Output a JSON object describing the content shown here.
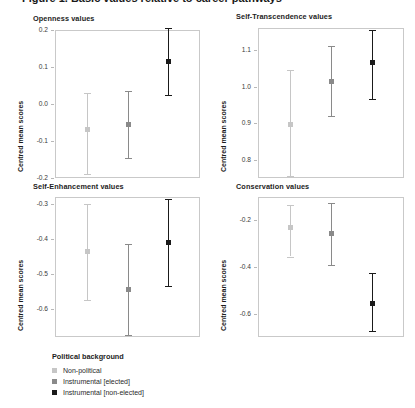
{
  "figure": {
    "title_clipped": "Figure 1. Basic values relative to career pathways"
  },
  "axis": {
    "ylabel": "Centred mean scores"
  },
  "legend": {
    "title": "Political background",
    "entries": [
      {
        "label": "Non-political",
        "color": "#c6c6c6"
      },
      {
        "label": "Instrumental [elected]",
        "color": "#8a8a8a"
      },
      {
        "label": "Instrumental [non-elected]",
        "color": "#1a1a1a"
      }
    ]
  },
  "chart_data": {
    "type": "scatter",
    "title": "Figure 1. Basic values relative to career pathways",
    "xlabel": "",
    "ylabel": "Centred mean scores",
    "grid": false,
    "legend_position": "bottom-left",
    "legend_title": "Political background",
    "categories": [
      "Non-political",
      "Instrumental [elected]",
      "Instrumental [non-elected]"
    ],
    "colors": [
      "#c6c6c6",
      "#8a8a8a",
      "#1a1a1a"
    ],
    "error_bars": "95% confidence interval",
    "panels": [
      {
        "title": "Openness values",
        "ylim": [
          -0.2,
          0.2
        ],
        "yticks": [
          "0.2",
          "0.1",
          "0.0",
          "-0.1",
          "-0.2"
        ],
        "ytick_values": [
          0.2,
          0.1,
          0.0,
          -0.1,
          -0.2
        ],
        "values": [
          -0.07,
          -0.055,
          0.115
        ],
        "ci_low": [
          -0.19,
          -0.145,
          0.025
        ],
        "ci_high": [
          0.03,
          0.035,
          0.205
        ]
      },
      {
        "title": "Self-Transcendence values",
        "ylim": [
          0.75,
          1.16
        ],
        "yticks": [
          "1.1",
          "1.0",
          "0.9",
          "0.8"
        ],
        "ytick_values": [
          1.1,
          1.0,
          0.9,
          0.8
        ],
        "values": [
          0.895,
          1.015,
          1.065
        ],
        "ci_low": [
          0.755,
          0.92,
          0.965
        ],
        "ci_high": [
          1.045,
          1.11,
          1.155
        ]
      },
      {
        "title": "Self-Enhancement values",
        "ylim": [
          -0.68,
          -0.28
        ],
        "yticks": [
          "-0.3",
          "-0.4",
          "-0.5",
          "-0.6"
        ],
        "ytick_values": [
          -0.3,
          -0.4,
          -0.5,
          -0.6
        ],
        "values": [
          -0.435,
          -0.545,
          -0.41
        ],
        "ci_low": [
          -0.575,
          -0.675,
          -0.535
        ],
        "ci_high": [
          -0.3,
          -0.415,
          -0.285
        ]
      },
      {
        "title": "Conservation values",
        "ylim": [
          -0.7,
          -0.1
        ],
        "yticks": [
          "-0.2",
          "-0.4",
          "-0.6"
        ],
        "ytick_values": [
          -0.2,
          -0.4,
          -0.6
        ],
        "values": [
          -0.23,
          -0.255,
          -0.555
        ],
        "ci_low": [
          -0.355,
          -0.39,
          -0.675
        ],
        "ci_high": [
          -0.135,
          -0.125,
          -0.425
        ]
      }
    ]
  }
}
